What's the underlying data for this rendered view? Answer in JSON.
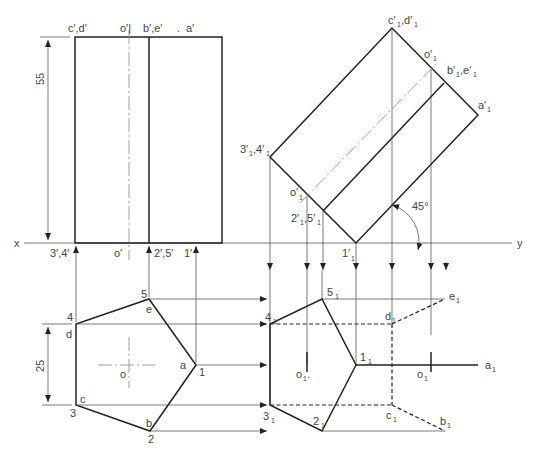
{
  "figure": {
    "reference_line": {
      "x_label": "x",
      "y_label": "y"
    },
    "dimensions": {
      "height": "55",
      "side": "25",
      "angle": "45°"
    },
    "front_view": {
      "labels": {
        "cd_top": "c′,d′",
        "o_top": "o′|",
        "be_top": "b′,e′",
        "dot": ".",
        "a_top": "a′",
        "p34": "3′,4′",
        "o_bottom": "o′",
        "p25": "2′,5′",
        "p1": "1′"
      }
    },
    "top_view": {
      "labels": {
        "p1": "1",
        "p2": "2",
        "p3": "3",
        "p4": "4",
        "p5": "5",
        "a": "a",
        "b": "b",
        "c": "c",
        "d": "d",
        "e": "e",
        "o": "o"
      }
    },
    "aux_elevation": {
      "labels": {
        "cd": "c′",
        "cd2": ",d′",
        "o_top": "o′",
        "be": "b′",
        "be2": ",e′",
        "a": "a′",
        "p34": "3′",
        "p34b": ",4′",
        "o_low": "o′",
        "p25": "2′",
        "p25b": ",5′",
        "p1": "1′"
      },
      "subscript": "1"
    },
    "aux_plan": {
      "labels": {
        "p1": "1",
        "p2": "2",
        "p3": "3",
        "p4": "4",
        "p5": "5",
        "a": "a",
        "b": "b",
        "c": "c",
        "d": "d",
        "e": "e",
        "o_left": "o",
        "o_right": "o",
        "o_dot": "."
      },
      "subscript": "1"
    }
  }
}
